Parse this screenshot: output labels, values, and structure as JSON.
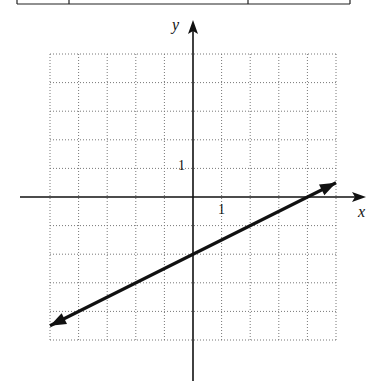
{
  "chart_data": {
    "type": "line",
    "title": "",
    "xlabel": "x",
    "ylabel": "y",
    "xlim": [
      -5,
      5
    ],
    "ylim": [
      -5,
      5
    ],
    "grid": true,
    "tick_labels": {
      "x": "1",
      "y": "1"
    },
    "series": [
      {
        "name": "line",
        "slope": 0.5,
        "intercept": -2,
        "x": [
          -5,
          5
        ],
        "y": [
          -4.5,
          0.5
        ],
        "arrows": "both"
      }
    ]
  },
  "labels": {
    "x_axis": "x",
    "y_axis": "y",
    "x_tick": "1",
    "y_tick": "1"
  }
}
